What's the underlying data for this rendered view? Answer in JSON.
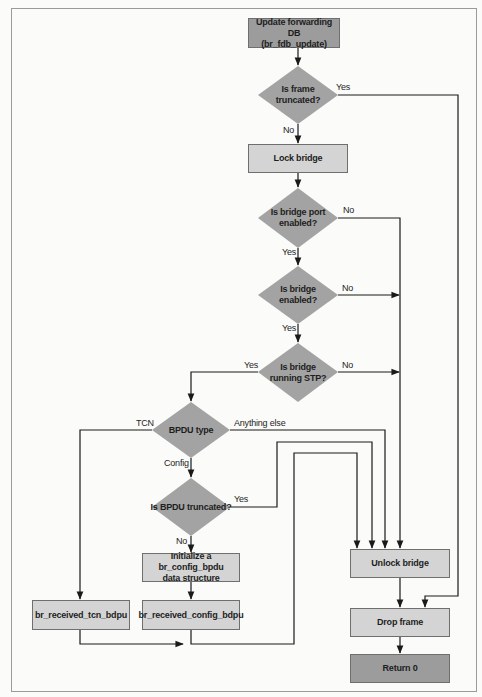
{
  "diagram": {
    "type": "flowchart",
    "colors": {
      "process_fill": "#d4d4d4",
      "terminal_fill": "#9c9c9c",
      "decision_fill": "#a3a3a3",
      "line": "#1a1a1a"
    },
    "nodes": {
      "start": {
        "line1": "Update forwarding DB",
        "line2": "(br_fdb_update)"
      },
      "frame_truncated": {
        "line1": "Is frame",
        "line2": "truncated?"
      },
      "lock_bridge": {
        "label": "Lock bridge"
      },
      "port_enabled": {
        "line1": "Is bridge port",
        "line2": "enabled?"
      },
      "bridge_enabled": {
        "line1": "Is bridge",
        "line2": "enabled?"
      },
      "running_stp": {
        "line1": "Is bridge",
        "line2": "running STP?"
      },
      "bpdu_type": {
        "label": "BPDU type"
      },
      "bpdu_truncated": {
        "label": "Is BPDU truncated?"
      },
      "init_config": {
        "line1": "Initialize a br_config_bpdu",
        "line2": "data structure"
      },
      "recv_tcn": {
        "label": "br_received_tcn_bdpu"
      },
      "recv_config": {
        "label": "br_received_config_bdpu"
      },
      "unlock_bridge": {
        "label": "Unlock bridge"
      },
      "drop_frame": {
        "label": "Drop frame"
      },
      "return0": {
        "label": "Return 0"
      }
    },
    "edge_labels": {
      "frame_truncated_yes": "Yes",
      "frame_truncated_no": "No",
      "port_enabled_no": "No",
      "port_enabled_yes": "Yes",
      "bridge_enabled_no": "No",
      "bridge_enabled_yes": "Yes",
      "running_stp_yes": "Yes",
      "running_stp_no": "No",
      "bpdu_tcn": "TCN",
      "bpdu_anything_else": "Anything else",
      "bpdu_config": "Config",
      "bpdu_truncated_yes": "Yes",
      "bpdu_truncated_no": "No"
    }
  }
}
